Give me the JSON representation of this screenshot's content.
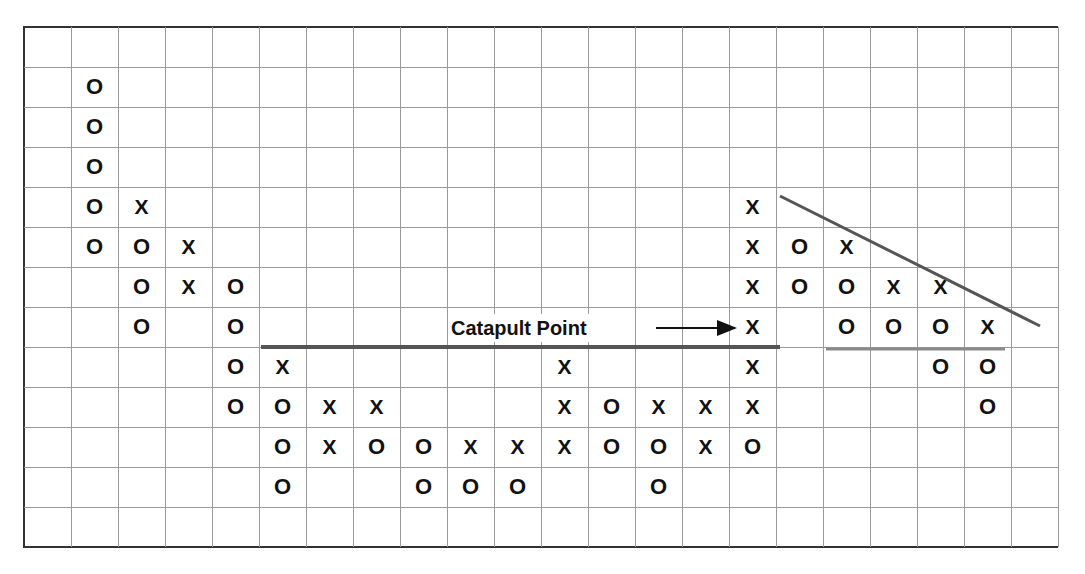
{
  "chart_data": {
    "type": "point-and-figure",
    "title": "",
    "grid": {
      "columns": 22,
      "rows": 13,
      "grid_on": true
    },
    "columns": [
      {
        "col": 1,
        "type": "O",
        "rows": [
          1,
          2,
          3,
          4,
          5
        ]
      },
      {
        "col": 2,
        "type": "X",
        "rows": [
          4
        ]
      },
      {
        "col": 2,
        "type": "O",
        "rows": [
          5,
          6,
          7
        ]
      },
      {
        "col": 3,
        "type": "X",
        "rows": [
          5,
          6
        ]
      },
      {
        "col": 4,
        "type": "O",
        "rows": [
          6,
          7,
          8,
          9
        ]
      },
      {
        "col": 5,
        "type": "X",
        "rows": [
          8
        ]
      },
      {
        "col": 5,
        "type": "O",
        "rows": [
          9,
          10,
          11
        ]
      },
      {
        "col": 6,
        "type": "X",
        "rows": [
          9,
          10
        ]
      },
      {
        "col": 7,
        "type": "X",
        "rows": [
          9
        ]
      },
      {
        "col": 7,
        "type": "O",
        "rows": [
          10
        ]
      },
      {
        "col": 8,
        "type": "O",
        "rows": [
          10,
          11
        ]
      },
      {
        "col": 9,
        "type": "X",
        "rows": [
          10
        ]
      },
      {
        "col": 9,
        "type": "O",
        "rows": [
          11
        ]
      },
      {
        "col": 10,
        "type": "X",
        "rows": [
          10
        ]
      },
      {
        "col": 10,
        "type": "O",
        "rows": [
          11
        ]
      },
      {
        "col": 11,
        "type": "X",
        "rows": [
          8,
          9,
          10
        ]
      },
      {
        "col": 12,
        "type": "O",
        "rows": [
          9,
          10
        ]
      },
      {
        "col": 13,
        "type": "X",
        "rows": [
          9
        ]
      },
      {
        "col": 13,
        "type": "O",
        "rows": [
          10,
          11
        ]
      },
      {
        "col": 14,
        "type": "X",
        "rows": [
          9,
          10
        ]
      },
      {
        "col": 15,
        "type": "X",
        "rows": [
          4,
          5,
          6,
          7,
          8,
          9
        ]
      },
      {
        "col": 15,
        "type": "O",
        "rows": [
          10
        ]
      },
      {
        "col": 16,
        "type": "O",
        "rows": [
          5,
          6
        ]
      },
      {
        "col": 17,
        "type": "X",
        "rows": [
          5
        ]
      },
      {
        "col": 17,
        "type": "O",
        "rows": [
          6,
          7
        ]
      },
      {
        "col": 18,
        "type": "X",
        "rows": [
          6
        ]
      },
      {
        "col": 18,
        "type": "O",
        "rows": [
          7
        ]
      },
      {
        "col": 19,
        "type": "X",
        "rows": [
          6
        ]
      },
      {
        "col": 19,
        "type": "O",
        "rows": [
          7,
          8
        ]
      },
      {
        "col": 20,
        "type": "X",
        "rows": [
          7
        ]
      },
      {
        "col": 20,
        "type": "O",
        "rows": [
          8,
          9
        ]
      }
    ],
    "lines": [
      {
        "name": "catapult-resistance-line",
        "x1": 261,
        "y1": 347,
        "x2": 780,
        "y2": 347,
        "color": "#555555",
        "width": 4
      },
      {
        "name": "support-line",
        "x1": 826,
        "y1": 349,
        "x2": 1005,
        "y2": 349,
        "color": "#8a8a8a",
        "width": 3
      },
      {
        "name": "downtrend-line",
        "x1": 780,
        "y1": 196,
        "x2": 1040,
        "y2": 326,
        "color": "#555555",
        "width": 3
      }
    ],
    "annotations": [
      {
        "text": "Catapult Point",
        "arrow": {
          "x1": 656,
          "y1": 328,
          "x2": 735,
          "y2": 328
        },
        "points_to": {
          "col": 15,
          "row": 7
        }
      }
    ],
    "xlabel": "",
    "ylabel": ""
  },
  "annotation": {
    "label": "Catapult Point"
  },
  "colors": {
    "grid": "#9a9a9a",
    "border": "#333333",
    "marks": "#111111"
  }
}
